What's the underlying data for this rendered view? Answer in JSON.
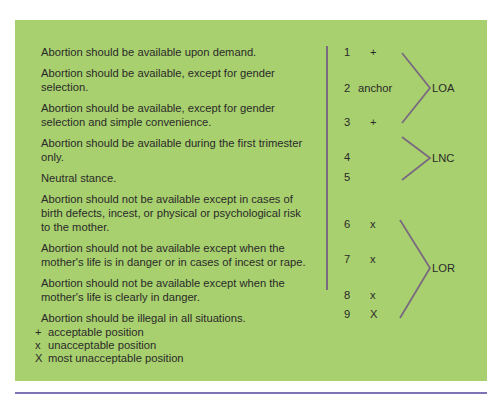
{
  "statements": [
    "Abortion should be available upon demand.",
    "Abortion should be available, except for gender selection.",
    "Abortion should be available, except for gender selection and simple convenience.",
    "Abortion should be available during the first trimester only.",
    "Neutral stance.",
    "Abortion should not be available except in cases of birth defects, incest, or physical or psychological risk to the mother.",
    "Abortion should not be available except when the mother's life is in danger or in cases of incest or rape.",
    "Abortion should not be available except when the mother's life is clearly in danger.",
    "Abortion should be illegal in all situations."
  ],
  "scale": [
    {
      "num": "1",
      "mark": "+"
    },
    {
      "num": "2",
      "mark": "anchor"
    },
    {
      "num": "3",
      "mark": "+"
    },
    {
      "num": "4",
      "mark": ""
    },
    {
      "num": "5",
      "mark": ""
    },
    {
      "num": "6",
      "mark": "x"
    },
    {
      "num": "7",
      "mark": "x"
    },
    {
      "num": "8",
      "mark": "x"
    },
    {
      "num": "9",
      "mark": "X"
    }
  ],
  "groups": {
    "loa": "LOA",
    "lnc": "LNC",
    "lor": "LOR"
  },
  "legend": [
    {
      "symbol": "+",
      "label": "acceptable position"
    },
    {
      "symbol": "x",
      "label": "unacceptable position"
    },
    {
      "symbol": "X",
      "label": "most unacceptable position"
    }
  ],
  "colors": {
    "panel": "#a8d06e",
    "bracket": "#7a6a80",
    "rule": "#7d74b8"
  }
}
